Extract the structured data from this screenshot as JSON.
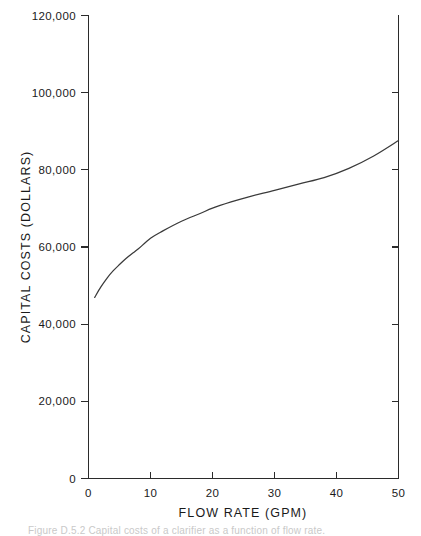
{
  "figure": {
    "caption": "Figure D.5.2  Capital costs of a clarifier as a function of flow rate."
  },
  "chart_data": {
    "type": "line",
    "title": "",
    "xlabel": "FLOW RATE (GPM)",
    "ylabel": "CAPITAL COSTS (DOLLARS)",
    "xlim": [
      0,
      50
    ],
    "ylim": [
      0,
      120000
    ],
    "grid": false,
    "legend": null,
    "xticks": [
      0,
      10,
      20,
      30,
      40,
      50
    ],
    "xticklabels": [
      "0",
      "10",
      "20",
      "30",
      "40",
      "50"
    ],
    "yticks": [
      0,
      20000,
      40000,
      60000,
      80000,
      100000,
      120000
    ],
    "yticklabels": [
      "0",
      "20,000",
      "40,000",
      "60,000",
      "80,000",
      "100,000",
      "120,000"
    ],
    "series": [
      {
        "name": "Capital cost",
        "x": [
          1,
          2,
          3,
          4,
          5,
          6,
          7,
          8,
          10,
          12,
          15,
          18,
          20,
          23,
          26,
          30,
          34,
          38,
          42,
          46,
          50
        ],
        "y": [
          46900,
          49600,
          51900,
          53800,
          55400,
          56900,
          58200,
          59400,
          62200,
          64100,
          66600,
          68600,
          70000,
          71600,
          73000,
          74600,
          76300,
          77900,
          80300,
          83500,
          87500
        ]
      }
    ]
  },
  "axes": {
    "y_axis_name": "capital-costs-axis",
    "x_axis_name": "flow-rate-axis"
  }
}
